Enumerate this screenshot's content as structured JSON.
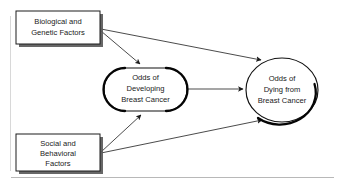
{
  "diagram": {
    "background_color": "#ffffff",
    "line_color": "#2b2b2b",
    "text_color": "#1a1a1a",
    "nodes": [
      {
        "id": "biological",
        "shape": "rectangle",
        "lines": [
          "Biological and",
          "Genetic Factors"
        ],
        "line1": "Biological and",
        "line2": "Genetic Factors",
        "line3": ""
      },
      {
        "id": "social",
        "shape": "rectangle",
        "lines": [
          "Social and",
          "Behavioral",
          "Factors"
        ],
        "line1": "Social and",
        "line2": "Behavioral",
        "line3": "Factors"
      },
      {
        "id": "developing",
        "shape": "rounded-rectangle",
        "lines": [
          "Odds of",
          "Developing",
          "Breast Cancer"
        ],
        "line1": "Odds of",
        "line2": "Developing",
        "line3": "Breast Cancer"
      },
      {
        "id": "dying",
        "shape": "ellipse",
        "lines": [
          "Odds of",
          "Dying from",
          "Breast Cancer"
        ],
        "line1": "Odds of",
        "line2": "Dying from",
        "line3": "Breast Cancer"
      }
    ],
    "edges": [
      {
        "id": "biological-to-developing",
        "from": "biological",
        "to": "developing",
        "arrow": "single"
      },
      {
        "id": "biological-to-dying",
        "from": "biological",
        "to": "dying",
        "arrow": "single"
      },
      {
        "id": "social-to-developing",
        "from": "social",
        "to": "developing",
        "arrow": "single"
      },
      {
        "id": "social-to-dying",
        "from": "social",
        "to": "dying",
        "arrow": "single"
      },
      {
        "id": "developing-to-dying",
        "from": "developing",
        "to": "dying",
        "arrow": "single"
      }
    ]
  }
}
